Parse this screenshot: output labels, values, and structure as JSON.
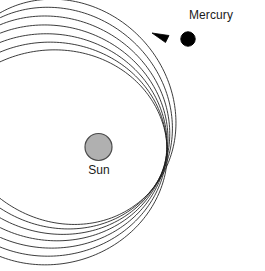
{
  "figure": {
    "width": 265,
    "height": 271,
    "background_color": "#ffffff"
  },
  "labels": {
    "mercury": "Mercury",
    "sun": "Sun"
  },
  "bodies": {
    "sun": {
      "name": "Sun",
      "cx": 98.5,
      "cy": 147,
      "r": 13.5,
      "fill_color": "#b0b0b0",
      "stroke_color": "#4a4a4a",
      "stroke_width": 1.2
    },
    "mercury": {
      "name": "Mercury",
      "cx": 188,
      "cy": 39,
      "r": 7.2,
      "fill_color": "#000000",
      "stroke_color": "#000000"
    }
  },
  "arrow": {
    "name": "direction-of-motion-arrow",
    "tip_x": 152,
    "tip_y": 33,
    "color": "#000000",
    "description": "counterclockwise direction of orbital motion"
  },
  "chart_data": {
    "type": "line",
    "xlabel": "",
    "ylabel": "",
    "grid": false,
    "legend": "none",
    "annotations": [
      "Mercury",
      "Sun"
    ],
    "focus": {
      "x": 98.5,
      "y": 147
    },
    "orbit_count": 7,
    "semi_major_axis": 118,
    "semi_minor_axis": 107,
    "eccentricity": 0.42,
    "precession_step_deg": 9.5,
    "start_angle_deg": -12,
    "stroke_color": "#1a1a1a",
    "stroke_width": 0.85,
    "orbits": [
      {
        "index": 1,
        "rotation_deg": -12.0
      },
      {
        "index": 2,
        "rotation_deg": -2.5
      },
      {
        "index": 3,
        "rotation_deg": 7.0
      },
      {
        "index": 4,
        "rotation_deg": 16.5
      },
      {
        "index": 5,
        "rotation_deg": 26.0
      },
      {
        "index": 6,
        "rotation_deg": 35.5
      },
      {
        "index": 7,
        "rotation_deg": 45.0
      }
    ]
  }
}
